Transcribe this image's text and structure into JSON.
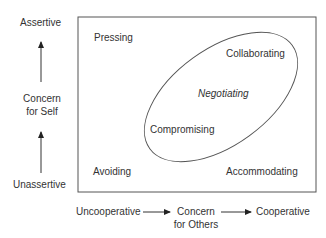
{
  "y_axis": {
    "top": "Assertive",
    "middle_line1": "Concern",
    "middle_line2": "for Self",
    "bottom": "Unassertive"
  },
  "x_axis": {
    "left": "Uncooperative",
    "middle_line1": "Concern",
    "middle_line2": "for Others",
    "right": "Cooperative"
  },
  "quadrants": {
    "top_left": "Pressing",
    "top_right": "Collaborating",
    "center": "Negotiating",
    "center_left": "Compromising",
    "bottom_left": "Avoiding",
    "bottom_right": "Accommodating"
  },
  "colors": {
    "line": "#555555",
    "text": "#333333"
  }
}
